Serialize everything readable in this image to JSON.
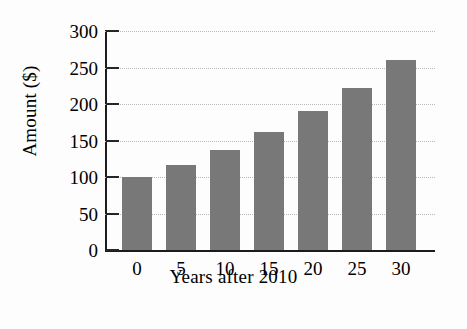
{
  "chart_data": {
    "type": "bar",
    "title": "",
    "subtitle": "",
    "xlabel": "Years after 2010",
    "ylabel": "Amount ($)",
    "categories": [
      "0",
      "5",
      "10",
      "15",
      "20",
      "25",
      "30"
    ],
    "values": [
      100,
      117,
      137,
      161,
      190,
      222,
      260
    ],
    "series": [
      {
        "name": "Amount",
        "values": [
          100,
          117,
          137,
          161,
          190,
          222,
          260
        ]
      }
    ],
    "ylim": [
      0,
      300
    ],
    "ytick_labels": [
      "0",
      "50",
      "100",
      "150",
      "200",
      "250",
      "300"
    ],
    "ytick_values": [
      0,
      50,
      100,
      150,
      200,
      250,
      300
    ],
    "xtick_labels": [
      "0",
      "5",
      "10",
      "15",
      "20",
      "25",
      "30"
    ],
    "grid": true,
    "grid_axis": "y",
    "grid_style": "dotted",
    "legend": false,
    "legend_position": "none",
    "bar_color": "#787878",
    "axis_color": "#1c1c1c",
    "grid_color": "#b9b9b9",
    "background_color": "#fdfdfd",
    "annotations": []
  }
}
